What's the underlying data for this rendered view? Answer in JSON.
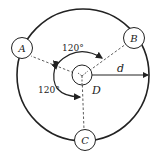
{
  "diagram": {
    "type": "bolt-circle / three-point layout",
    "nodes": [
      {
        "id": "A",
        "label": "A"
      },
      {
        "id": "B",
        "label": "B"
      },
      {
        "id": "C",
        "label": "C"
      }
    ],
    "center_label": "D",
    "radius_label": "d",
    "angles": [
      {
        "label": "120°",
        "between": "A-B"
      },
      {
        "label": "120°",
        "between": "A-C"
      }
    ],
    "colors": {
      "stroke": "#222222",
      "background": "#ffffff"
    }
  }
}
